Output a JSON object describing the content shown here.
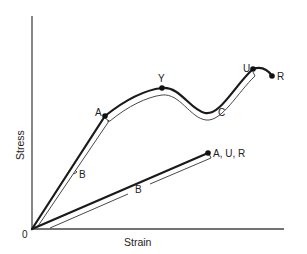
{
  "diagram": {
    "title": "",
    "axes": {
      "x_label": "Strain",
      "y_label": "Stress",
      "origin_label": "0"
    },
    "curves": [
      {
        "name": "ductile-curve",
        "description": "Stress-strain curve with yield, necking and rupture",
        "points": [
          {
            "label": "A",
            "meaning": "proportional limit"
          },
          {
            "label": "Y",
            "meaning": "yield point"
          },
          {
            "label": "U",
            "meaning": "ultimate strength"
          },
          {
            "label": "R",
            "meaning": "rupture"
          }
        ],
        "region_labels": [
          "B",
          "C"
        ]
      },
      {
        "name": "brittle-curve",
        "description": "Linear curve where A, U and R coincide",
        "end_label": "A, U, R",
        "region_labels": [
          "B"
        ]
      }
    ],
    "labels": {
      "A": "A",
      "Y": "Y",
      "U": "U",
      "R": "R",
      "AUR": "A, U, R",
      "B1": "B",
      "B2": "B",
      "C": "C"
    },
    "colors": {
      "curve": "#1a1a1a",
      "bracket": "#333333",
      "axis": "#444444"
    }
  }
}
